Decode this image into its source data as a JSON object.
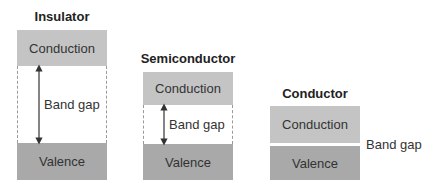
{
  "diagram": {
    "panels": [
      {
        "title": "Insulator",
        "conduction_label": "Conduction",
        "gap_label": "Band gap",
        "valence_label": "Valence",
        "gap_size": "large"
      },
      {
        "title": "Semiconductor",
        "conduction_label": "Conduction",
        "gap_label": "Band gap",
        "valence_label": "Valence",
        "gap_size": "small"
      },
      {
        "title": "Conductor",
        "conduction_label": "Conduction",
        "gap_label": "Band gap",
        "valence_label": "Valence",
        "gap_size": "none"
      }
    ],
    "colors": {
      "conduction": "#c4c4c4",
      "valence": "#a9a9a9",
      "arrow": "#333333"
    }
  }
}
